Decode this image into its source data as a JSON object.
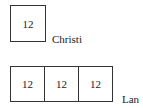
{
  "christi": {
    "name": "Christi",
    "boxes": [
      "12"
    ]
  },
  "lan": {
    "name": "Lan",
    "boxes": [
      "12",
      "12",
      "12"
    ]
  }
}
